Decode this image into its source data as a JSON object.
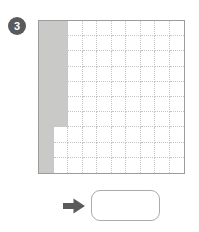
{
  "item": {
    "number": "3"
  },
  "colors": {
    "page_bg": "#ffffff",
    "badge": "#595a5c",
    "badge_text": "#ffffff",
    "grid_border": "#9c9c9c",
    "grid_line": "#c6c6c6",
    "cell_shade": "#c9cac7",
    "arrow": "#595a5c",
    "answer_box_border": "#ababab",
    "answer_box_fill": "#ffffff"
  },
  "grid": {
    "rows": 10,
    "cols": 10,
    "total_cells": 100,
    "shaded_cells": 17,
    "fill_order": "column-major-from-top-left",
    "full_columns_shaded": 1,
    "partial_column_shaded_cells": 7
  },
  "arrow": {
    "direction": "right"
  },
  "answer": {
    "value": ""
  }
}
